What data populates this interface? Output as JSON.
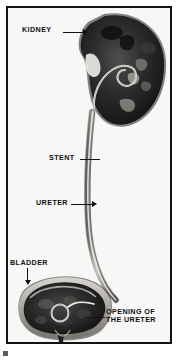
{
  "figure": {
    "type": "medical-illustration",
    "style": "grayscale photographic plate with black frame",
    "palette": {
      "frame": "#141414",
      "background": "#f7f7f6",
      "organ_dark": "#1d1d1d",
      "organ_mid": "#4a4a4a",
      "stent_light": "#e9e7e2",
      "label_text": "#101010"
    }
  },
  "labels": {
    "kidney": "KIDNEY",
    "stent": "STENT",
    "ureter": "URETER",
    "bladder": "BLADDER",
    "opening_line1": "OPENING OF",
    "opening_line2": "THE URETER"
  },
  "anatomy": {
    "kidney": {
      "name": "kidney",
      "description": "bean-shaped dark organ, upper right"
    },
    "ureter": {
      "name": "ureter",
      "description": "long narrow tube from kidney to bladder"
    },
    "stent": {
      "name": "ureteral stent",
      "description": "light tube with proximal coil in renal pelvis and distal coil in bladder"
    },
    "bladder": {
      "name": "bladder",
      "description": "rounded dark organ at lower left"
    },
    "ureteric_orifice": {
      "name": "opening of the ureter",
      "description": "ureteral orifice inside bladder where stent coil sits"
    }
  }
}
